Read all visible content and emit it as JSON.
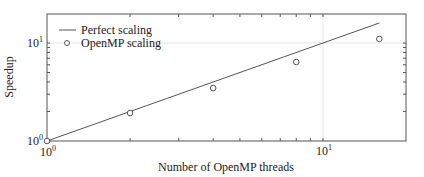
{
  "chart_data": {
    "type": "line",
    "title": "",
    "xlabel": "Number of OpenMP threads",
    "ylabel": "Speedup",
    "xscale": "log",
    "yscale": "log",
    "xlim": [
      1,
      20
    ],
    "ylim": [
      1,
      20
    ],
    "x_tick_labels": [
      {
        "base": "10",
        "exp": "0",
        "value": 1
      },
      {
        "base": "10",
        "exp": "1",
        "value": 10
      }
    ],
    "y_tick_labels": [
      {
        "base": "10",
        "exp": "0",
        "value": 1
      },
      {
        "base": "10",
        "exp": "1",
        "value": 10
      }
    ],
    "grid": true,
    "legend_position": "upper left",
    "series": [
      {
        "name": "Perfect scaling",
        "style": "line",
        "color": "#555555",
        "x": [
          1,
          16
        ],
        "y": [
          1,
          16
        ]
      },
      {
        "name": "OpenMP scaling",
        "style": "markers-circle-open",
        "color": "#555555",
        "x": [
          1,
          2,
          4,
          8,
          16
        ],
        "y": [
          1.0,
          1.93,
          3.47,
          6.4,
          11.0
        ]
      }
    ]
  },
  "legend": {
    "items": [
      {
        "label": "Perfect scaling",
        "symbol": "line"
      },
      {
        "label": "OpenMP scaling",
        "symbol": "circle"
      }
    ]
  },
  "axes": {
    "xlabel": "Number of OpenMP threads",
    "ylabel": "Speedup",
    "x0_base": "10",
    "x0_exp": "0",
    "x1_base": "10",
    "x1_exp": "1",
    "y0_base": "10",
    "y0_exp": "0",
    "y1_base": "10",
    "y1_exp": "1"
  }
}
